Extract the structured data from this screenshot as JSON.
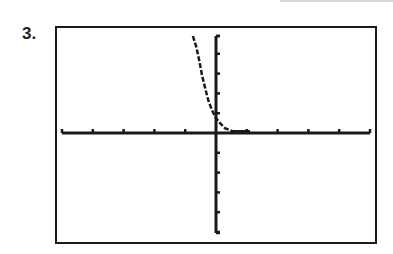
{
  "problem": {
    "number_label": "3."
  },
  "chart_data": {
    "type": "line",
    "title": "",
    "xlabel": "",
    "ylabel": "",
    "xlim": [
      -5,
      5
    ],
    "ylim": [
      -5,
      5
    ],
    "xscl": 1,
    "yscl": 1,
    "grid": false,
    "legend": null,
    "x_ticks": [
      -5,
      -4,
      -3,
      -2,
      -1,
      0,
      1,
      2,
      3,
      4,
      5
    ],
    "y_ticks": [
      -5,
      -4,
      -3,
      -2,
      -1,
      0,
      1,
      2,
      3,
      4,
      5
    ],
    "series": [
      {
        "name": "f(x)",
        "x": [
          -0.75,
          -0.65,
          -0.55,
          -0.45,
          -0.35,
          -0.25,
          -0.13,
          0,
          0.13,
          0.29,
          0.52,
          0.8,
          1.1
        ],
        "y": [
          4.9,
          4.4,
          3.7,
          2.9,
          2.25,
          1.65,
          1.15,
          0.75,
          0.5,
          0.25,
          0.1,
          0.05,
          0.03
        ]
      }
    ],
    "colors": {
      "axis": "#1a1a1a",
      "curve": "#1a1a1a",
      "frame": "#1a1a1a",
      "background": "#ffffff"
    }
  }
}
